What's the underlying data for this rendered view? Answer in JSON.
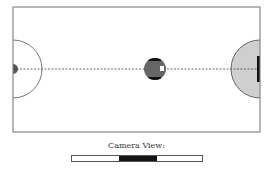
{
  "field": {
    "frame": {
      "x": 13,
      "y": 7,
      "width": 247,
      "height": 125,
      "stroke": "#888888"
    },
    "center_line_y": 69,
    "left_goal_area": {
      "cx": 13,
      "cy": 69,
      "r": 29,
      "fill": "none",
      "stroke": "#777777"
    },
    "left_goal_marker": {
      "cx": 13,
      "cy": 69,
      "r": 5,
      "fill": "#555555"
    },
    "right_goal_area": {
      "cx": 260,
      "cy": 69,
      "r": 29,
      "fill": "#cfcfcf",
      "stroke": "#666666"
    },
    "right_goal_bar": {
      "x": 257,
      "y": 56,
      "width": 3,
      "height": 26,
      "fill": "#111111"
    },
    "robot": {
      "cx": 155,
      "cy": 69,
      "r": 11,
      "fill": "#666666",
      "band_color": "#111111",
      "marker_color": "#ffffff"
    }
  },
  "camera": {
    "label": "Camera View:",
    "bar": {
      "x": 71,
      "width": 132
    },
    "window": {
      "start": 48,
      "width": 38,
      "color": "#151515"
    }
  }
}
